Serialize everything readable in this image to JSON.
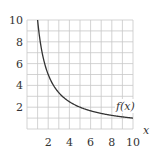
{
  "chart_data": {
    "type": "line",
    "title": "",
    "xlabel": "x",
    "ylabel": "",
    "xlim": [
      0,
      10
    ],
    "ylim": [
      0,
      10
    ],
    "grid": true,
    "grid_step": 1,
    "x_ticks": [
      2,
      4,
      6,
      8,
      10
    ],
    "y_ticks": [
      2,
      4,
      6,
      8,
      10
    ],
    "series": [
      {
        "name": "f(x)",
        "function": "10/x",
        "x": [
          1,
          1.25,
          1.5,
          2,
          2.5,
          3,
          4,
          5,
          6,
          7,
          8,
          9,
          10
        ],
        "values": [
          10,
          8,
          6.67,
          5,
          4,
          3.33,
          2.5,
          2,
          1.67,
          1.43,
          1.25,
          1.11,
          1
        ]
      }
    ],
    "annotations": [
      {
        "text": "f(x)",
        "x": 9.4,
        "y": 1.8
      }
    ]
  },
  "labels": {
    "x_axis": "x",
    "function": "f(x)",
    "x_ticks": [
      "2",
      "4",
      "6",
      "8",
      "10"
    ],
    "y_ticks": [
      "2",
      "4",
      "6",
      "8",
      "10"
    ]
  },
  "colors": {
    "grid": "#c8c8c8",
    "curve": "#333333",
    "text": "#333333"
  }
}
